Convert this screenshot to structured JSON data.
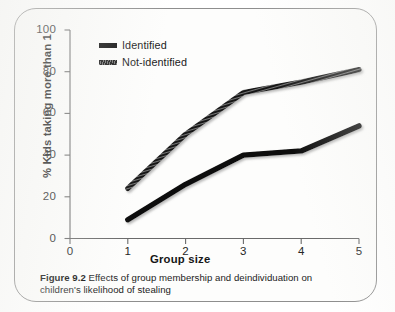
{
  "figure": {
    "caption_label": "Figure 9.2",
    "caption_text": "Effects of group membership and deindividuation on children's likelihood of stealing"
  },
  "chart_data": {
    "type": "line",
    "title": "",
    "xlabel": "Group size",
    "ylabel": "% Kids taking more than 1",
    "x": [
      1,
      2,
      3,
      4,
      5
    ],
    "xlim": [
      0,
      5
    ],
    "ylim": [
      0,
      100
    ],
    "xticks": [
      "0",
      "1",
      "2",
      "3",
      "4",
      "5"
    ],
    "yticks": [
      "0",
      "20",
      "40",
      "60",
      "80",
      "100"
    ],
    "grid": false,
    "legend_position": "upper-left-inside",
    "series": [
      {
        "name": "Identified",
        "values": [
          9,
          26,
          40,
          42,
          54
        ],
        "color": "#0c0c0c",
        "style": "solid-thick"
      },
      {
        "name": "Not-identified",
        "values": [
          24,
          50,
          70,
          75,
          81
        ],
        "color": "#141414",
        "style": "hatched-thick"
      }
    ]
  },
  "axes": {
    "y_ticks": [
      {
        "label": "100",
        "value": 100
      },
      {
        "label": "80",
        "value": 80
      },
      {
        "label": "60",
        "value": 60
      },
      {
        "label": "40",
        "value": 40
      },
      {
        "label": "20",
        "value": 20
      },
      {
        "label": "0",
        "value": 0
      }
    ],
    "x_ticks": [
      {
        "label": "0",
        "value": 0
      },
      {
        "label": "1",
        "value": 1
      },
      {
        "label": "2",
        "value": 2
      },
      {
        "label": "3",
        "value": 3
      },
      {
        "label": "4",
        "value": 4
      },
      {
        "label": "5",
        "value": 5
      }
    ]
  },
  "colors": {
    "series_identified": "#0c0c0c",
    "series_not_identified": "#141414",
    "axis": "#5a5a5a",
    "border": "#8e8e8e",
    "background": "#fdfdfc"
  }
}
